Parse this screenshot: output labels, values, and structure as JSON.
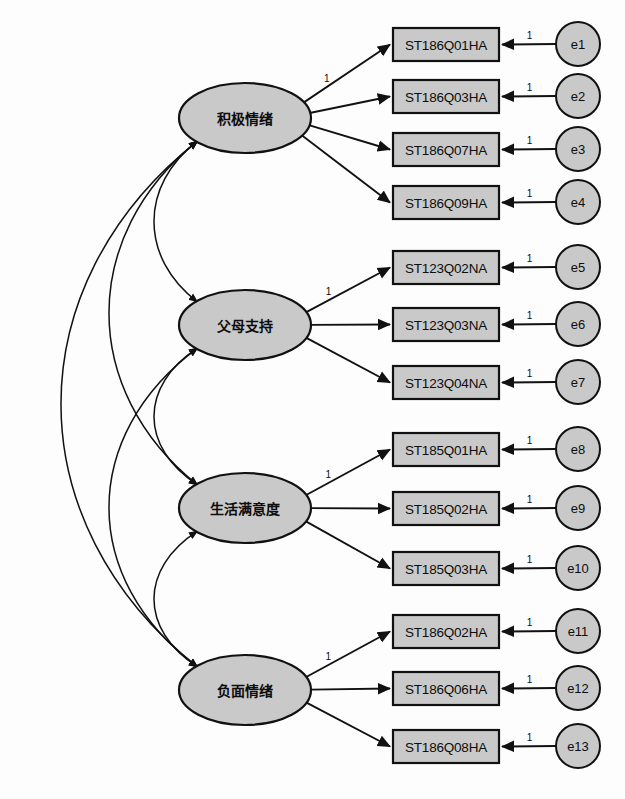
{
  "diagram": {
    "type": "structural-equation-model",
    "colors": {
      "node_fill": "#c9c9c9",
      "stroke": "#111111",
      "background": "#fdfdfd"
    }
  },
  "factors": [
    {
      "id": "f1",
      "label": "积极情绪",
      "cx": 245,
      "cy": 118,
      "rx": 66,
      "ry": 35
    },
    {
      "id": "f2",
      "label": "父母支持",
      "cx": 245,
      "cy": 325,
      "rx": 66,
      "ry": 35
    },
    {
      "id": "f3",
      "label": "生活满意度",
      "cx": 245,
      "cy": 508,
      "rx": 66,
      "ry": 35
    },
    {
      "id": "f4",
      "label": "负面情绪",
      "cx": 245,
      "cy": 690,
      "rx": 66,
      "ry": 35
    }
  ],
  "indicators": [
    {
      "id": "i1",
      "label": "ST186Q01HA",
      "factor": "f1",
      "x": 393,
      "y": 28,
      "w": 106,
      "h": 33,
      "loading": "1",
      "show_loading": true,
      "error": "e1",
      "error_one": "1"
    },
    {
      "id": "i2",
      "label": "ST186Q03HA",
      "factor": "f1",
      "x": 393,
      "y": 80,
      "w": 106,
      "h": 33,
      "loading": "",
      "show_loading": false,
      "error": "e2",
      "error_one": "1"
    },
    {
      "id": "i3",
      "label": "ST186Q07HA",
      "factor": "f1",
      "x": 393,
      "y": 133,
      "w": 106,
      "h": 33,
      "loading": "",
      "show_loading": false,
      "error": "e3",
      "error_one": "1"
    },
    {
      "id": "i4",
      "label": "ST186Q09HA",
      "factor": "f1",
      "x": 393,
      "y": 186,
      "w": 106,
      "h": 33,
      "loading": "",
      "show_loading": false,
      "error": "e4",
      "error_one": "1"
    },
    {
      "id": "i5",
      "label": "ST123Q02NA",
      "factor": "f2",
      "x": 393,
      "y": 251,
      "w": 106,
      "h": 33,
      "loading": "1",
      "show_loading": true,
      "error": "e5",
      "error_one": "1"
    },
    {
      "id": "i6",
      "label": "ST123Q03NA",
      "factor": "f2",
      "x": 393,
      "y": 308,
      "w": 106,
      "h": 33,
      "loading": "",
      "show_loading": false,
      "error": "e6",
      "error_one": "1"
    },
    {
      "id": "i7",
      "label": "ST123Q04NA",
      "factor": "f2",
      "x": 393,
      "y": 366,
      "w": 106,
      "h": 33,
      "loading": "",
      "show_loading": false,
      "error": "e7",
      "error_one": "1"
    },
    {
      "id": "i8",
      "label": "ST185Q01HA",
      "factor": "f3",
      "x": 393,
      "y": 433,
      "w": 106,
      "h": 33,
      "loading": "1",
      "show_loading": true,
      "error": "e8",
      "error_one": "1"
    },
    {
      "id": "i9",
      "label": "ST185Q02HA",
      "factor": "f3",
      "x": 393,
      "y": 492,
      "w": 106,
      "h": 33,
      "loading": "",
      "show_loading": false,
      "error": "e9",
      "error_one": "1"
    },
    {
      "id": "i10",
      "label": "ST185Q03HA",
      "factor": "f3",
      "x": 393,
      "y": 552,
      "w": 106,
      "h": 33,
      "loading": "",
      "show_loading": false,
      "error": "e10",
      "error_one": "1"
    },
    {
      "id": "i11",
      "label": "ST186Q02HA",
      "factor": "f4",
      "x": 393,
      "y": 615,
      "w": 106,
      "h": 33,
      "loading": "1",
      "show_loading": true,
      "error": "e11",
      "error_one": "1"
    },
    {
      "id": "i12",
      "label": "ST186Q06HA",
      "factor": "f4",
      "x": 393,
      "y": 672,
      "w": 106,
      "h": 33,
      "loading": "",
      "show_loading": false,
      "error": "e12",
      "error_one": "1"
    },
    {
      "id": "i13",
      "label": "ST186Q08HA",
      "factor": "f4",
      "x": 393,
      "y": 730,
      "w": 106,
      "h": 33,
      "loading": "",
      "show_loading": false,
      "error": "e13",
      "error_one": "1"
    }
  ],
  "error_terms": [
    {
      "id": "e1",
      "label": "e1",
      "cx": 578,
      "cy": 44,
      "r": 22
    },
    {
      "id": "e2",
      "label": "e2",
      "cx": 578,
      "cy": 96,
      "r": 22
    },
    {
      "id": "e3",
      "label": "e3",
      "cx": 578,
      "cy": 149,
      "r": 22
    },
    {
      "id": "e4",
      "label": "e4",
      "cx": 578,
      "cy": 202,
      "r": 22
    },
    {
      "id": "e5",
      "label": "e5",
      "cx": 578,
      "cy": 267,
      "r": 22
    },
    {
      "id": "e6",
      "label": "e6",
      "cx": 578,
      "cy": 324,
      "r": 22
    },
    {
      "id": "e7",
      "label": "e7",
      "cx": 578,
      "cy": 382,
      "r": 22
    },
    {
      "id": "e8",
      "label": "e8",
      "cx": 578,
      "cy": 449,
      "r": 22
    },
    {
      "id": "e9",
      "label": "e9",
      "cx": 578,
      "cy": 508,
      "r": 22
    },
    {
      "id": "e10",
      "label": "e10",
      "cx": 578,
      "cy": 568,
      "r": 22
    },
    {
      "id": "e11",
      "label": "e11",
      "cx": 578,
      "cy": 631,
      "r": 22
    },
    {
      "id": "e12",
      "label": "e12",
      "cx": 578,
      "cy": 688,
      "r": 22
    },
    {
      "id": "e13",
      "label": "e13",
      "cx": 578,
      "cy": 746,
      "r": 22
    }
  ],
  "covariances": [
    {
      "id": "cov-f1-f2",
      "from": "f1",
      "to": "f2",
      "bulge": 58
    },
    {
      "id": "cov-f2-f3",
      "from": "f2",
      "to": "f3",
      "bulge": 58
    },
    {
      "id": "cov-f3-f4",
      "from": "f3",
      "to": "f4",
      "bulge": 58
    },
    {
      "id": "cov-f1-f3",
      "from": "f1",
      "to": "f3",
      "bulge": 118
    },
    {
      "id": "cov-f2-f4",
      "from": "f2",
      "to": "f4",
      "bulge": 118
    },
    {
      "id": "cov-f1-f4",
      "from": "f1",
      "to": "f4",
      "bulge": 182
    }
  ]
}
